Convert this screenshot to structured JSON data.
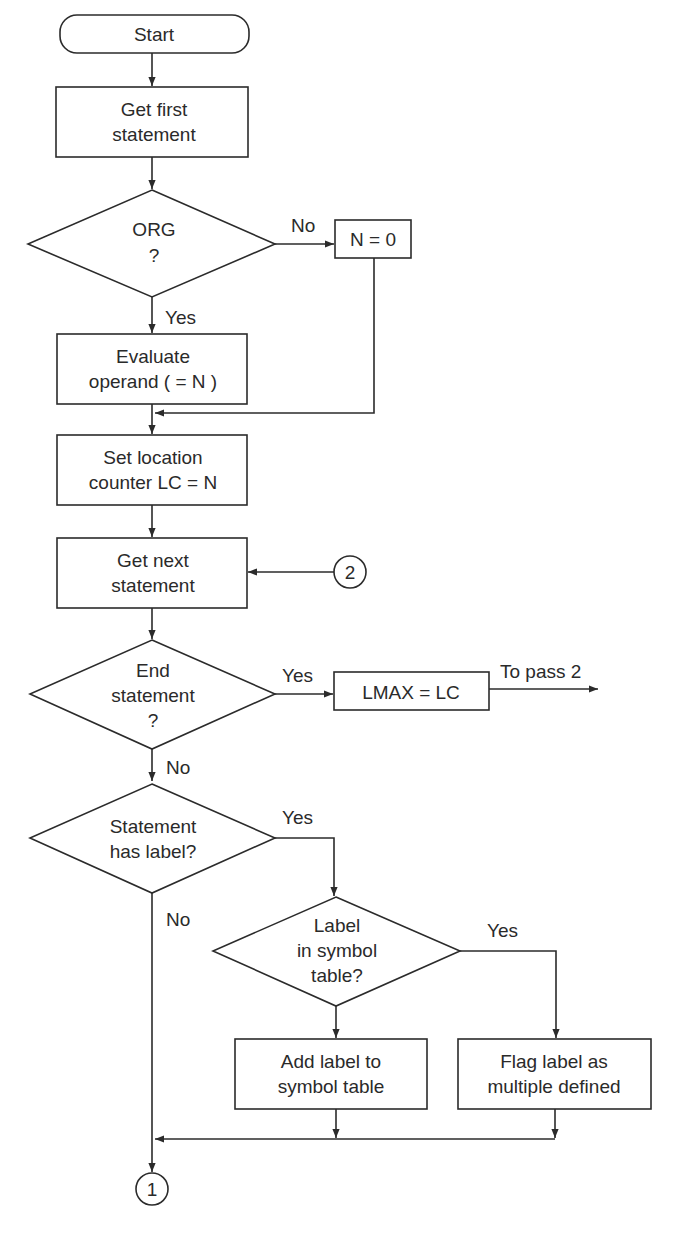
{
  "diagram": {
    "type": "flowchart",
    "colors": {
      "stroke": "#2b2b2b",
      "text": "#2a2a2a",
      "background": "#ffffff"
    },
    "nodes": {
      "start": {
        "label": "Start"
      },
      "get_first": {
        "line1": "Get first",
        "line2": "statement"
      },
      "org": {
        "line1": "ORG",
        "line2": "?"
      },
      "n_zero": {
        "label": "N = 0"
      },
      "evaluate": {
        "line1": "Evaluate",
        "line2": "operand ( = N )"
      },
      "set_lc": {
        "line1": "Set location",
        "line2": "counter LC = N"
      },
      "get_next": {
        "line1": "Get next",
        "line2": "statement"
      },
      "end_stmt": {
        "line1": "End",
        "line2": "statement",
        "line3": "?"
      },
      "lmax": {
        "label": "LMAX = LC"
      },
      "has_label": {
        "line1": "Statement",
        "line2": "has label?"
      },
      "in_symtab": {
        "line1": "Label",
        "line2": "in symbol",
        "line3": "table?"
      },
      "add_label": {
        "line1": "Add label to",
        "line2": "symbol table"
      },
      "flag_label": {
        "line1": "Flag label as",
        "line2": "multiple defined"
      },
      "connector_2": {
        "label": "2"
      },
      "connector_1": {
        "label": "1"
      }
    },
    "edges": {
      "org_no": "No",
      "org_yes": "Yes",
      "end_yes": "Yes",
      "end_no": "No",
      "to_pass2": "To pass 2",
      "has_label_yes": "Yes",
      "has_label_no": "No",
      "in_symtab_yes": "Yes"
    }
  }
}
